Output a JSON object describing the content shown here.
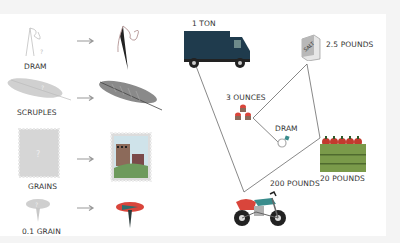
{
  "left_panel": {
    "rows": [
      {
        "label": "DRAM",
        "unknown_icon": "ghost-needle-icon",
        "known_icon": "needle-icon"
      },
      {
        "label": "SCRUPLES",
        "unknown_icon": "ghost-feather-icon",
        "known_icon": "feather-icon"
      },
      {
        "label": "GRAINS",
        "unknown_icon": "ghost-stamp-icon",
        "known_icon": "stamp-icon"
      },
      {
        "label": "0.1 GRAIN",
        "unknown_icon": "ghost-pin-icon",
        "known_icon": "pushpin-icon"
      }
    ],
    "placeholder_glyph": "?",
    "arrow": "right-arrow-icon"
  },
  "right_panel": {
    "items": [
      {
        "label": "1 TON",
        "icon": "truck-icon"
      },
      {
        "label": "2.5 POUNDS",
        "icon": "salt-box-icon",
        "box_text": "SALT"
      },
      {
        "label": "3 OUNCES",
        "icon": "cupcakes-icon"
      },
      {
        "label": "DRAM",
        "icon": "ring-icon"
      },
      {
        "label": "20 POUNDS",
        "icon": "apple-crate-icon"
      },
      {
        "label": "200 POUNDS",
        "icon": "motorcycle-icon"
      }
    ]
  },
  "colors": {
    "ghost": "#c8c8c8",
    "truck": "#1f3b4d",
    "red": "#d9453b",
    "teal": "#3a8c8c",
    "green": "#7a9a4a",
    "line": "#555555"
  }
}
